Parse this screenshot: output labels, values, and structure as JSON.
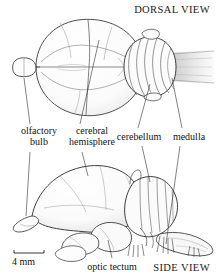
{
  "figure": {
    "type": "anatomical-illustration",
    "views": {
      "dorsal": "DORSAL VIEW",
      "side": "SIDE VIEW"
    },
    "scale_bar": {
      "label": "4 mm"
    },
    "labels": [
      {
        "id": "olfactory-bulb",
        "line1": "olfactory",
        "line2": "bulb"
      },
      {
        "id": "cerebral-hemisphere",
        "line1": "cerebral",
        "line2": "hemisphere"
      },
      {
        "id": "cerebellum",
        "line1": "cerebellum",
        "line2": ""
      },
      {
        "id": "medulla",
        "line1": "medulla",
        "line2": ""
      },
      {
        "id": "optic-tectum",
        "line1": "optic tectum",
        "line2": ""
      }
    ],
    "colors": {
      "ink": "#2b2b2b",
      "fine_line": "#6b6b6b",
      "shading": "#cfcfcf",
      "background": "#ffffff"
    }
  }
}
